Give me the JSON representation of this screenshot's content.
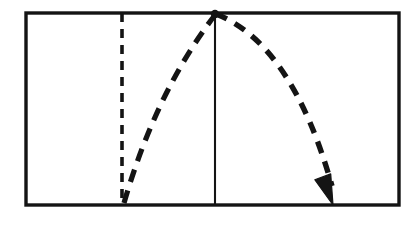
{
  "figure": {
    "background_color": "#ffffff",
    "ink_color": "#111111",
    "canvas": {
      "width": 409,
      "height": 225
    },
    "frame": {
      "name": "outer-rectangle",
      "left": 26,
      "top": 13,
      "right": 399,
      "bottom": 205,
      "stroke_width": 3.4,
      "stroke_color": "#141414"
    },
    "vertical_dashed_line": {
      "name": "launch-reference-line",
      "x": 122,
      "top": 13,
      "bottom": 205,
      "stroke_width": 3.6,
      "dash": "9 7",
      "stroke_color": "#141414"
    },
    "vertical_solid_line": {
      "name": "apex-reference-line",
      "x": 215,
      "top": 13,
      "bottom": 205,
      "stroke_width": 2.1,
      "stroke_color": "#141414"
    },
    "ascending_path": {
      "name": "ascent-dashed-path",
      "start_x": 124,
      "start_y": 203,
      "end_x": 215,
      "end_y": 15,
      "control_x": 156,
      "control_y": 92,
      "stroke_width": 5.2,
      "dash": "13 9",
      "stroke_color": "#141414"
    },
    "descending_arc": {
      "name": "descent-dashed-arc",
      "start_x": 216,
      "start_y": 14,
      "end_x": 332,
      "end_y": 186,
      "control_x": 292,
      "control_y": 44,
      "stroke_width": 5.4,
      "dash": "12 9",
      "stroke_color": "#141414"
    },
    "arrowhead": {
      "name": "impact-arrowhead",
      "tip_x": 333,
      "tip_y": 205,
      "width": 17,
      "length": 30,
      "angle_deg": 70,
      "fill_color": "#141414"
    },
    "apex_marker": {
      "name": "apex-junction-blob",
      "x": 215,
      "y": 14,
      "radius": 4.2,
      "fill_color": "#141414"
    }
  },
  "chart_data": {
    "type": "line",
    "xlabel": "",
    "ylabel": "",
    "xlim": [
      26,
      399
    ],
    "ylim": [
      205,
      13
    ],
    "grid": false,
    "legend": "none",
    "annotations": [
      "Dashed vertical reference line at launch abscissa",
      "Solid vertical reference line through apex",
      "Arrowhead marks landing point on baseline"
    ],
    "series": [
      {
        "name": "Ascending dashed path",
        "style": "dashed",
        "x": [
          124,
          140,
          156,
          172,
          188,
          200,
          208,
          215
        ],
        "y": [
          203,
          168,
          134,
          102,
          70,
          46,
          29,
          15
        ]
      },
      {
        "name": "Descending dashed arc",
        "style": "dashed",
        "x": [
          216,
          240,
          260,
          280,
          295,
          310,
          322,
          330,
          333
        ],
        "y": [
          14,
          26,
          42,
          68,
          95,
          128,
          160,
          186,
          205
        ]
      }
    ]
  }
}
